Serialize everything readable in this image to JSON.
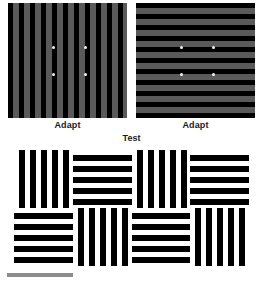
{
  "figure": {
    "width": 263,
    "height": 284,
    "background_color": "#ffffff"
  },
  "adapt": {
    "left_panel": {
      "caption": "Adapt",
      "orientation": "vertical",
      "bar_color": "#000000",
      "gap_color": "#5a5a5a",
      "stripe_period_px": 11,
      "fixation_dots": [
        {
          "x": 44,
          "y": 43
        },
        {
          "x": 76,
          "y": 43
        },
        {
          "x": 44,
          "y": 70
        },
        {
          "x": 76,
          "y": 70
        }
      ],
      "fixation_dot_color": "#f2f2f2"
    },
    "right_panel": {
      "caption": "Adapt",
      "orientation": "horizontal",
      "bar_color": "#000000",
      "gap_color": "#5a5a5a",
      "stripe_period_px": 11,
      "fixation_dots": [
        {
          "x": 44,
          "y": 43
        },
        {
          "x": 76,
          "y": 43
        },
        {
          "x": 44,
          "y": 70
        },
        {
          "x": 76,
          "y": 70
        }
      ],
      "fixation_dot_color": "#f2f2f2"
    }
  },
  "test": {
    "caption": "Test",
    "bar_color": "#000000",
    "gap_color": "#ffffff",
    "stripe_period_px": 11,
    "grid": {
      "columns": 4,
      "rows": 2,
      "cells": [
        {
          "row": 0,
          "col": 0,
          "orientation": "vertical"
        },
        {
          "row": 0,
          "col": 1,
          "orientation": "horizontal"
        },
        {
          "row": 0,
          "col": 2,
          "orientation": "vertical"
        },
        {
          "row": 0,
          "col": 3,
          "orientation": "horizontal"
        },
        {
          "row": 1,
          "col": 0,
          "orientation": "horizontal"
        },
        {
          "row": 1,
          "col": 1,
          "orientation": "vertical"
        },
        {
          "row": 1,
          "col": 2,
          "orientation": "horizontal"
        },
        {
          "row": 1,
          "col": 3,
          "orientation": "vertical"
        }
      ]
    }
  },
  "scale_bar": {
    "color": "#8c8c8c",
    "label": ""
  }
}
